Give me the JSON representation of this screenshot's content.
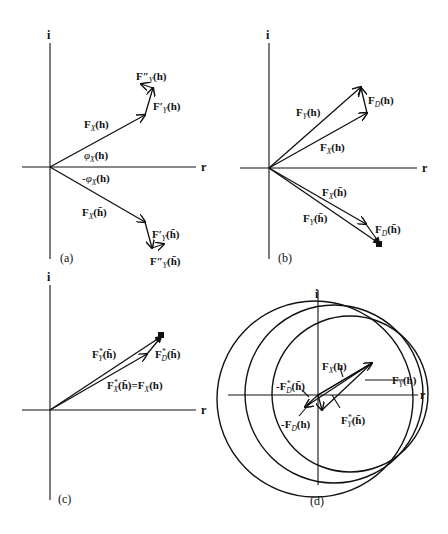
{
  "figure": {
    "axis_labels": {
      "imag": "i",
      "real": "r"
    },
    "panels": [
      {
        "id": "a",
        "caption": "(a)",
        "labels": {
          "fy2_h": "F″",
          "fy1_h": "F′",
          "fx_h": "F",
          "phi_pos": "φ",
          "phi_neg": "-φ",
          "fx_hbar": "F",
          "fy1_hbar": "F′",
          "fy2_hbar": "F″"
        },
        "subscripts": {
          "X": "X",
          "Y": "Y"
        },
        "args": {
          "h": "(h)",
          "hbar": "(h̄)"
        }
      },
      {
        "id": "b",
        "caption": "(b)",
        "labels": {
          "fy_h": "F",
          "fd_h": "F",
          "fx_h": "F",
          "fx_hbar": "F",
          "fy_hbar": "F",
          "fd_hbar": "F"
        },
        "subscripts": {
          "X": "X",
          "Y": "Y",
          "D": "D"
        }
      },
      {
        "id": "c",
        "caption": "(c)",
        "labels": {
          "fy_star": "F",
          "fd_star": "F",
          "fx_star_eq": "=F"
        },
        "subscripts": {
          "X": "X",
          "Y": "Y",
          "D": "D",
          "star": "*"
        }
      },
      {
        "id": "d",
        "caption": "(d)",
        "labels": {
          "fx_h": "F",
          "fy_h": "F",
          "neg_fd_star": "-F",
          "neg_fd_h": "-F",
          "fy_star": "F"
        },
        "subscripts": {
          "X": "X",
          "Y": "Y",
          "D": "D",
          "star": "*"
        }
      }
    ],
    "colors": {
      "ink": "#111111",
      "background": "#ffffff"
    }
  }
}
